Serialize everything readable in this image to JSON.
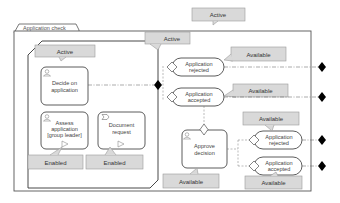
{
  "diagram": {
    "case_title": "Application check",
    "stage": {
      "name": "Application check stage",
      "state_label": "Active"
    },
    "case_state_label": "Active",
    "tasks": [
      {
        "id": "decide",
        "label_lines": [
          "Decide on",
          "application"
        ],
        "type": "human-task"
      },
      {
        "id": "assess",
        "label_lines": [
          "Assess",
          "application",
          "[group leader]"
        ],
        "type": "human-task",
        "state_label": "Enabled"
      },
      {
        "id": "document",
        "label_lines": [
          "Document",
          "request"
        ],
        "type": "process-task",
        "state_label": "Enabled"
      },
      {
        "id": "approve",
        "label_lines": [
          "Approve",
          "decision"
        ],
        "type": "human-task",
        "state_label": "Available"
      }
    ],
    "milestones": [
      {
        "id": "m1",
        "label_lines": [
          "Application",
          "rejected"
        ],
        "state_label": "Available"
      },
      {
        "id": "m2",
        "label_lines": [
          "Application",
          "accepted"
        ],
        "state_label": "Available"
      },
      {
        "id": "m3",
        "label_lines": [
          "Application",
          "rejected"
        ],
        "state_label": "Available"
      },
      {
        "id": "m4",
        "label_lines": [
          "Application",
          "accepted"
        ],
        "state_label": "Available"
      }
    ],
    "colors": {
      "tag_fill": "#d9d9d9",
      "tag_stroke": "#9a9a9a",
      "line": "#333333",
      "sentry": "#000000"
    }
  }
}
